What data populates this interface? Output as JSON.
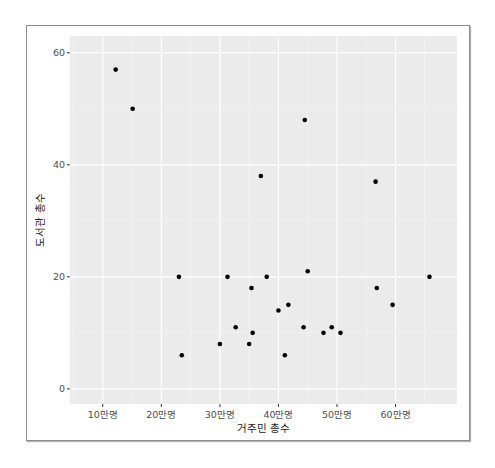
{
  "chart_data": {
    "type": "scatter",
    "title": "",
    "xlabel": "거주민 총수",
    "ylabel": "도서관 총수",
    "x_unit": "만명",
    "xlim": [
      4.4,
      70.5
    ],
    "ylim": [
      -2.7,
      63.0
    ],
    "x_ticks": [
      10,
      20,
      30,
      40,
      50,
      60
    ],
    "x_tick_labels": [
      "10만명",
      "20만명",
      "30만명",
      "40만명",
      "50만명",
      "60만명"
    ],
    "y_ticks": [
      0,
      20,
      40,
      60
    ],
    "y_tick_labels": [
      "0",
      "20",
      "40",
      "60"
    ],
    "grid": true,
    "legend": "none",
    "colors": {
      "panel_bg": "#ebebeb",
      "grid_major": "#ffffff",
      "point": "#000000",
      "frame": "#8c8c8c"
    },
    "points": [
      {
        "x": 12.2,
        "y": 57
      },
      {
        "x": 15.1,
        "y": 50
      },
      {
        "x": 23.0,
        "y": 20
      },
      {
        "x": 23.5,
        "y": 6
      },
      {
        "x": 30.0,
        "y": 8
      },
      {
        "x": 31.3,
        "y": 20
      },
      {
        "x": 32.7,
        "y": 11
      },
      {
        "x": 35.0,
        "y": 8
      },
      {
        "x": 35.4,
        "y": 18
      },
      {
        "x": 35.6,
        "y": 10
      },
      {
        "x": 37.0,
        "y": 38
      },
      {
        "x": 38.0,
        "y": 20
      },
      {
        "x": 40.0,
        "y": 14
      },
      {
        "x": 41.1,
        "y": 6
      },
      {
        "x": 41.7,
        "y": 15
      },
      {
        "x": 44.3,
        "y": 11
      },
      {
        "x": 44.5,
        "y": 48
      },
      {
        "x": 45.0,
        "y": 21
      },
      {
        "x": 47.7,
        "y": 10
      },
      {
        "x": 49.1,
        "y": 11
      },
      {
        "x": 50.6,
        "y": 10
      },
      {
        "x": 56.6,
        "y": 37
      },
      {
        "x": 56.8,
        "y": 18
      },
      {
        "x": 59.5,
        "y": 15
      },
      {
        "x": 65.8,
        "y": 20
      }
    ]
  }
}
